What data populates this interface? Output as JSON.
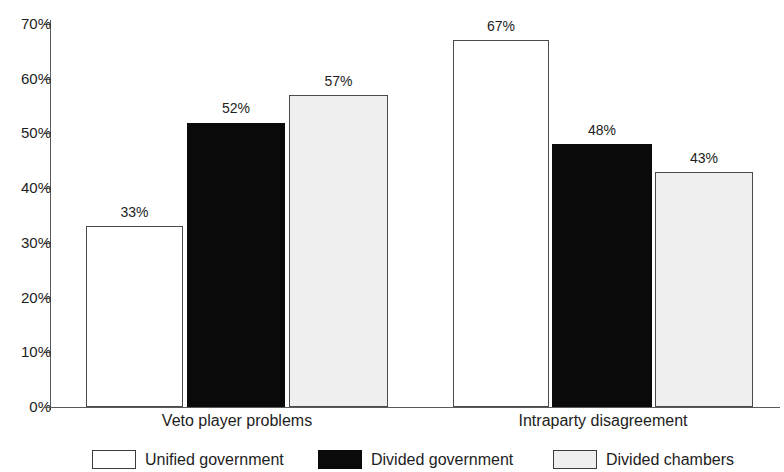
{
  "chart_data": {
    "type": "bar",
    "title": "",
    "subtitle": "",
    "xlabel": "",
    "ylabel": "",
    "categories": [
      "Veto player problems",
      "Intraparty disagreement"
    ],
    "series": [
      {
        "name": "Unified government",
        "color": "#ffffff",
        "border_color": "#4a4a4a",
        "values": [
          33,
          67
        ],
        "labels": [
          "33%",
          "67%"
        ]
      },
      {
        "name": "Divided government",
        "color": "#0a0a0a",
        "border_color": "#0a0a0a",
        "values": [
          52,
          48
        ],
        "labels": [
          "52%",
          "48%"
        ]
      },
      {
        "name": "Divided chambers",
        "color": "#efefef",
        "border_color": "#4a4a4a",
        "values": [
          57,
          43
        ],
        "labels": [
          "57%",
          "43%"
        ]
      }
    ],
    "ylim": [
      0,
      70
    ],
    "ytick_values": [
      0,
      10,
      20,
      30,
      40,
      50,
      60,
      70
    ],
    "ytick_labels": [
      "0%",
      "10%",
      "20%",
      "30%",
      "40%",
      "50%",
      "60%",
      "70%"
    ],
    "grid": false,
    "legend_position": "bottom",
    "axis_color": "#5a5a5a"
  },
  "yaxis": {
    "ticks": [
      {
        "label": "70%",
        "value": 70
      },
      {
        "label": "60%",
        "value": 60
      },
      {
        "label": "50%",
        "value": 50
      },
      {
        "label": "40%",
        "value": 40
      },
      {
        "label": "30%",
        "value": 30
      },
      {
        "label": "20%",
        "value": 20
      },
      {
        "label": "10%",
        "value": 10
      },
      {
        "label": "0%",
        "value": 0
      }
    ]
  },
  "xaxis": {
    "categories": [
      {
        "label": "Veto player problems"
      },
      {
        "label": "Intraparty disagreement"
      }
    ]
  },
  "bars": [
    {
      "label": "33%",
      "value": 33,
      "series": "Unified government",
      "category": "Veto player problems",
      "style": "series-unified"
    },
    {
      "label": "52%",
      "value": 52,
      "series": "Divided government",
      "category": "Veto player problems",
      "style": "series-divgov"
    },
    {
      "label": "57%",
      "value": 57,
      "series": "Divided chambers",
      "category": "Veto player problems",
      "style": "series-divcham"
    },
    {
      "label": "67%",
      "value": 67,
      "series": "Unified government",
      "category": "Intraparty disagreement",
      "style": "series-unified"
    },
    {
      "label": "48%",
      "value": 48,
      "series": "Divided government",
      "category": "Intraparty disagreement",
      "style": "series-divgov"
    },
    {
      "label": "43%",
      "value": 43,
      "series": "Divided chambers",
      "category": "Intraparty disagreement",
      "style": "series-divcham"
    }
  ],
  "legend": {
    "items": [
      {
        "label": "Unified government",
        "style": "sw-unified"
      },
      {
        "label": "Divided government",
        "style": "sw-divgov"
      },
      {
        "label": "Divided chambers",
        "style": "sw-divcham"
      }
    ]
  }
}
